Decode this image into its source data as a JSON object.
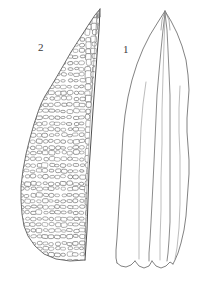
{
  "plate": {
    "kind": "botanical-line-illustration",
    "background_color": "#ffffff",
    "ink_color": "#555555",
    "width": 201,
    "height": 281
  },
  "figures": [
    {
      "number": "1",
      "label": "1",
      "name": "whole-leaf-outline",
      "description": "Lanceolate leaf with acuminate apex, undulate margins, percurrent costa and notched base",
      "label_position": {
        "x": 123,
        "y": 44
      }
    },
    {
      "number": "2",
      "label": "2",
      "name": "leaf-cell-detail",
      "description": "Upper leaf lamina cell detail showing rounded-quadrate to elongate laminal cells",
      "label_position": {
        "x": 38,
        "y": 42
      }
    }
  ],
  "cell_detail": {
    "cell_outline_color": "#6a6a6a",
    "cell_fill_color": "#ffffff",
    "approx_cell_count": 640,
    "cell_shapes": [
      "rounded-quadrate",
      "oval",
      "elongate-rectangular"
    ]
  }
}
